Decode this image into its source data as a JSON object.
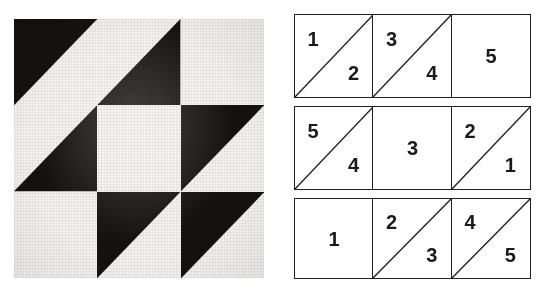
{
  "figure": {
    "colors": {
      "fabric_dark": "#141210",
      "fabric_light": "#f3f2f0",
      "diagram_line": "#231f20",
      "diagram_fill": "#ffffff",
      "number_text": "#1a1a1a"
    }
  },
  "photo": {
    "name": "quilt-block-photo",
    "rows": 3,
    "cols": 3,
    "cells": [
      {
        "id": "photo-cell-r1c1",
        "row": 1,
        "col": 1,
        "type": "half-square-triangle",
        "dark_corner": "upper-left",
        "light_corner": "lower-right",
        "seam": "bottom-left-to-top-right"
      },
      {
        "id": "photo-cell-r1c2",
        "row": 1,
        "col": 2,
        "type": "half-square-triangle",
        "dark_corner": "lower-right",
        "light_corner": "upper-left",
        "seam": "bottom-left-to-top-right"
      },
      {
        "id": "photo-cell-r1c3",
        "row": 1,
        "col": 3,
        "type": "plain",
        "dark_corner": "none",
        "light_corner": "all",
        "seam": "none"
      },
      {
        "id": "photo-cell-r2c1",
        "row": 2,
        "col": 1,
        "type": "half-square-triangle",
        "dark_corner": "lower-right",
        "light_corner": "upper-left",
        "seam": "bottom-left-to-top-right"
      },
      {
        "id": "photo-cell-r2c2",
        "row": 2,
        "col": 2,
        "type": "plain",
        "dark_corner": "none",
        "light_corner": "all",
        "seam": "none"
      },
      {
        "id": "photo-cell-r2c3",
        "row": 2,
        "col": 3,
        "type": "half-square-triangle",
        "dark_corner": "upper-left",
        "light_corner": "lower-right",
        "seam": "bottom-left-to-top-right"
      },
      {
        "id": "photo-cell-r3c1",
        "row": 3,
        "col": 1,
        "type": "plain",
        "dark_corner": "none",
        "light_corner": "all",
        "seam": "none"
      },
      {
        "id": "photo-cell-r3c2",
        "row": 3,
        "col": 2,
        "type": "half-square-triangle",
        "dark_corner": "upper-left",
        "light_corner": "lower-right",
        "seam": "bottom-left-to-top-right"
      },
      {
        "id": "photo-cell-r3c3",
        "row": 3,
        "col": 3,
        "type": "half-square-triangle",
        "dark_corner": "upper-left",
        "light_corner": "lower-right",
        "seam": "bottom-left-to-top-right"
      }
    ]
  },
  "diagram": {
    "name": "piecing-order-diagram",
    "rows": [
      {
        "row_index": 1,
        "cells": [
          {
            "id": "diagram-cell-r1c1",
            "has_diagonal": true,
            "diagonal": "bottom-left-to-top-right",
            "upper_left_number": "1",
            "lower_right_number": "2",
            "center_number": ""
          },
          {
            "id": "diagram-cell-r1c2",
            "has_diagonal": true,
            "diagonal": "bottom-left-to-top-right",
            "upper_left_number": "3",
            "lower_right_number": "4",
            "center_number": ""
          },
          {
            "id": "diagram-cell-r1c3",
            "has_diagonal": false,
            "diagonal": "none",
            "upper_left_number": "",
            "lower_right_number": "",
            "center_number": "5"
          }
        ]
      },
      {
        "row_index": 2,
        "cells": [
          {
            "id": "diagram-cell-r2c1",
            "has_diagonal": true,
            "diagonal": "bottom-left-to-top-right",
            "upper_left_number": "5",
            "lower_right_number": "4",
            "center_number": ""
          },
          {
            "id": "diagram-cell-r2c2",
            "has_diagonal": false,
            "diagonal": "none",
            "upper_left_number": "",
            "lower_right_number": "",
            "center_number": "3"
          },
          {
            "id": "diagram-cell-r2c3",
            "has_diagonal": true,
            "diagonal": "bottom-left-to-top-right",
            "upper_left_number": "2",
            "lower_right_number": "1",
            "center_number": ""
          }
        ]
      },
      {
        "row_index": 3,
        "cells": [
          {
            "id": "diagram-cell-r3c1",
            "has_diagonal": false,
            "diagonal": "none",
            "upper_left_number": "",
            "lower_right_number": "",
            "center_number": "1"
          },
          {
            "id": "diagram-cell-r3c2",
            "has_diagonal": true,
            "diagonal": "bottom-left-to-top-right",
            "upper_left_number": "2",
            "lower_right_number": "3",
            "center_number": ""
          },
          {
            "id": "diagram-cell-r3c3",
            "has_diagonal": true,
            "diagonal": "bottom-left-to-top-right",
            "upper_left_number": "4",
            "lower_right_number": "5",
            "center_number": ""
          }
        ]
      }
    ]
  }
}
